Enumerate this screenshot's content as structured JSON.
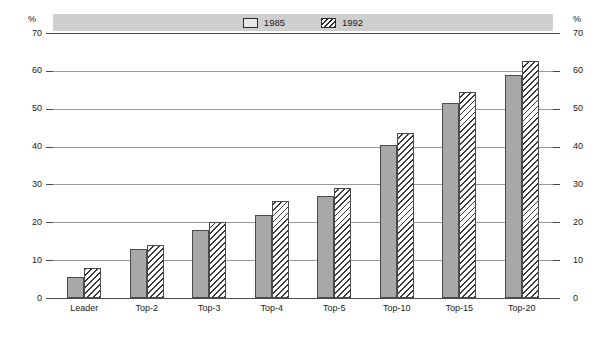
{
  "axis": {
    "unit_left": "%",
    "unit_right": "%",
    "ticks": [
      "70",
      "60",
      "50",
      "40",
      "30",
      "20",
      "10",
      "0"
    ]
  },
  "legend": {
    "entries": [
      {
        "label": "1985",
        "swatch": "solid-gray-swatch",
        "color": "#a8a8a8"
      },
      {
        "label": "1992",
        "swatch": "diagonal-hatch-swatch",
        "color": "#ffffff"
      }
    ]
  },
  "chart_data": {
    "type": "bar",
    "title": "",
    "subtitle": "",
    "xlabel": "",
    "ylabel": "%",
    "ylim": [
      0,
      70
    ],
    "ytick_step": 10,
    "grid": true,
    "legend_position": "top-center",
    "categories": [
      "Leader",
      "Top-2",
      "Top-3",
      "Top-4",
      "Top-5",
      "Top-10",
      "Top-15",
      "Top-20"
    ],
    "series": [
      {
        "name": "1985",
        "values": [
          5.5,
          13,
          18,
          22,
          27,
          40.5,
          51.5,
          59
        ]
      },
      {
        "name": "1992",
        "values": [
          8,
          14,
          20,
          25.5,
          29,
          43.5,
          54.5,
          62.5
        ]
      }
    ]
  }
}
